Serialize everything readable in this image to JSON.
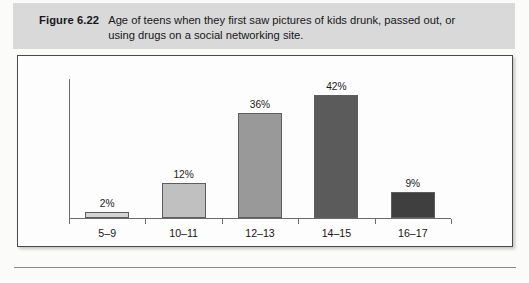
{
  "figure": {
    "label": "Figure 6.22",
    "caption": "Age of teens when they first saw pictures of kids drunk, passed out, or using drugs on a social networking site."
  },
  "chart_data": {
    "type": "bar",
    "title": "Age of teens when they first saw pictures of kids drunk, passed out, or using drugs on a social networking site.",
    "xlabel": "",
    "ylabel": "",
    "categories": [
      "5–9",
      "10–11",
      "12–13",
      "14–15",
      "16–17"
    ],
    "values": [
      2,
      12,
      36,
      42,
      9
    ],
    "value_labels": [
      "2%",
      "12%",
      "36%",
      "42%",
      "9%"
    ],
    "ylim": [
      0,
      48
    ],
    "grid": false,
    "legend": null,
    "bar_colors": [
      "#d5d5d5",
      "#c0c0c0",
      "#999999",
      "#5b5b5b",
      "#3f3f3f"
    ],
    "axis_color": "#6c6c6c"
  }
}
